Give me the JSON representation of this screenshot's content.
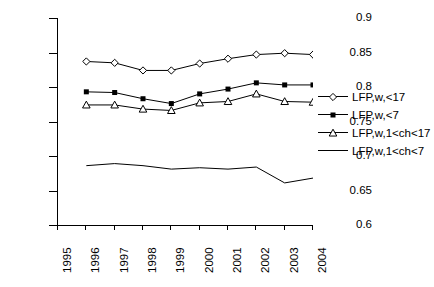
{
  "chart_data": {
    "type": "line",
    "title": "",
    "xlabel": "",
    "ylabel": "",
    "x": [
      1995,
      1996,
      1997,
      1998,
      1999,
      2000,
      2001,
      2002,
      2003,
      2004
    ],
    "xtick_labels": [
      "1995",
      "1996",
      "1997",
      "1998",
      "1999",
      "2000",
      "2001",
      "2002",
      "2003",
      "2004"
    ],
    "xlim": [
      1995,
      2004
    ],
    "ylim": [
      0.6,
      0.9
    ],
    "ytick_labels": [
      "0.9",
      "0.85",
      "0.8",
      "0.75",
      "0.7",
      "0.65",
      "0.6"
    ],
    "yticks": [
      0.9,
      0.85,
      0.8,
      0.75,
      0.7,
      0.65,
      0.6
    ],
    "grid": false,
    "legend_position": "right",
    "series": [
      {
        "name": "LFP,w,<17",
        "marker": "open-diamond",
        "x": [
          1996,
          1997,
          1998,
          1999,
          2000,
          2001,
          2002,
          2003,
          2004
        ],
        "values": [
          0.837,
          0.835,
          0.824,
          0.824,
          0.834,
          0.841,
          0.847,
          0.849,
          0.847
        ]
      },
      {
        "name": "LFP,w,<7",
        "marker": "filled-square",
        "x": [
          1996,
          1997,
          1998,
          1999,
          2000,
          2001,
          2002,
          2003,
          2004
        ],
        "values": [
          0.793,
          0.792,
          0.783,
          0.776,
          0.79,
          0.797,
          0.806,
          0.803,
          0.803
        ]
      },
      {
        "name": "LFP,w,1<ch<17",
        "marker": "open-triangle",
        "x": [
          1996,
          1997,
          1998,
          1999,
          2000,
          2001,
          2002,
          2003,
          2004
        ],
        "values": [
          0.774,
          0.774,
          0.768,
          0.766,
          0.777,
          0.779,
          0.79,
          0.779,
          0.778
        ]
      },
      {
        "name": "LFP,w,1<ch<7",
        "marker": "none",
        "x": [
          1996,
          1997,
          1998,
          1999,
          2000,
          2001,
          2002,
          2003,
          2004
        ],
        "values": [
          0.686,
          0.689,
          0.686,
          0.681,
          0.683,
          0.681,
          0.684,
          0.661,
          0.668
        ]
      }
    ]
  },
  "legend": {
    "items": [
      {
        "label": "LFP,w,<17"
      },
      {
        "label": "LFP,w,<7"
      },
      {
        "label": "LFP,w,1<ch<17"
      },
      {
        "label": "LFP,w,1<ch<7"
      }
    ]
  }
}
